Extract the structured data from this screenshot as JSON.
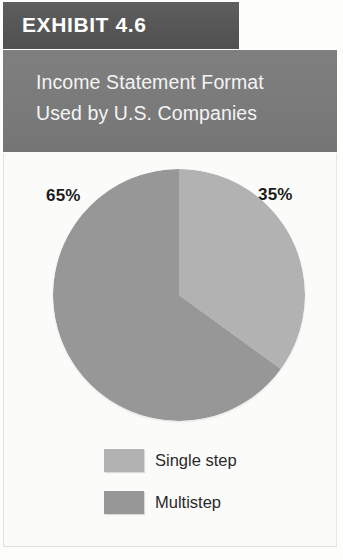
{
  "exhibit": {
    "number_label": "EXHIBIT 4.6",
    "banner_color": "#585858"
  },
  "title": {
    "line1": "Income Statement Format",
    "line2": "Used by U.S. Companies",
    "banner_color": "#7b7b7b",
    "text_color": "#f4f4f4"
  },
  "labels": {
    "left_pct": "65%",
    "right_pct": "35%"
  },
  "legend": {
    "items": [
      {
        "label": "Single step",
        "color": "#b2b2b2"
      },
      {
        "label": "Multistep",
        "color": "#979797"
      }
    ]
  },
  "chart_data": {
    "type": "pie",
    "title": "Income Statement Format Used by U.S. Companies",
    "subtitle": "",
    "categories": [
      "Single step",
      "Multistep"
    ],
    "values": [
      35,
      65
    ],
    "value_unit": "%",
    "data_labels": [
      "35%",
      "65%"
    ],
    "colors": [
      "#b2b2b2",
      "#979797"
    ],
    "start_angle_deg": 0,
    "direction": "clockwise",
    "legend_position": "bottom",
    "grid": false,
    "xlabel": "",
    "ylabel": ""
  }
}
